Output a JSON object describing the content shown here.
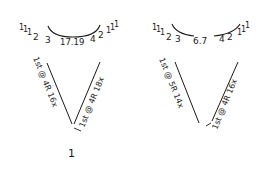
{
  "diagrams": [
    {
      "id": "left",
      "arc_numbers": "1 1 1 2 3 17.19 4 2 1 1 1",
      "arc_left_ticks": "1 1 1",
      "arc_left_values": "2 3",
      "arc_center_value": "17.19",
      "arc_right_values": "4 2",
      "arc_right_ticks": "1 1 1",
      "left_leg_label": "1st @ 4R 16x",
      "right_leg_label": "1st @ 4R 18x",
      "bottom_label": "1"
    },
    {
      "id": "right",
      "arc_numbers": "1 1 1 2 3 6.7 4 2 1 1 1",
      "arc_left_ticks": "1 1 1",
      "arc_left_values": "2 3",
      "arc_center_value": "6.7",
      "arc_right_values": "4 2",
      "arc_right_ticks": "1 1 1",
      "left_leg_label": "1st @ 5R 14x",
      "right_leg_label": "1st @ 4R 16x"
    }
  ],
  "colors": {
    "ink": "#1a1a1a",
    "paper": "#ffffff"
  }
}
